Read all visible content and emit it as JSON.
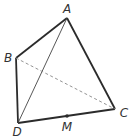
{
  "diagram": {
    "type": "tetrahedron",
    "colors": {
      "edge": "#2b2b2b",
      "hidden_edge": "#888888",
      "label": "#333333",
      "background": "#ffffff"
    },
    "points": {
      "A": {
        "label": "A",
        "x": 67,
        "y": 18,
        "lx": 67,
        "ly": 13
      },
      "B": {
        "label": "B",
        "x": 16,
        "y": 58,
        "lx": 8,
        "ly": 62
      },
      "C": {
        "label": "C",
        "x": 115,
        "y": 109,
        "lx": 124,
        "ly": 117
      },
      "D": {
        "label": "D",
        "x": 18,
        "y": 123,
        "lx": 17,
        "ly": 136
      },
      "M": {
        "label": "M",
        "x": 67,
        "y": 116,
        "lx": 67,
        "ly": 131
      }
    },
    "edges": [
      {
        "from": "A",
        "to": "B",
        "style": "solid-thick"
      },
      {
        "from": "A",
        "to": "C",
        "style": "solid-thick"
      },
      {
        "from": "B",
        "to": "D",
        "style": "solid-thick"
      },
      {
        "from": "D",
        "to": "C",
        "style": "solid-thick"
      },
      {
        "from": "A",
        "to": "D",
        "style": "solid-thin"
      },
      {
        "from": "B",
        "to": "C",
        "style": "dashed"
      }
    ],
    "marked_point": "M"
  }
}
